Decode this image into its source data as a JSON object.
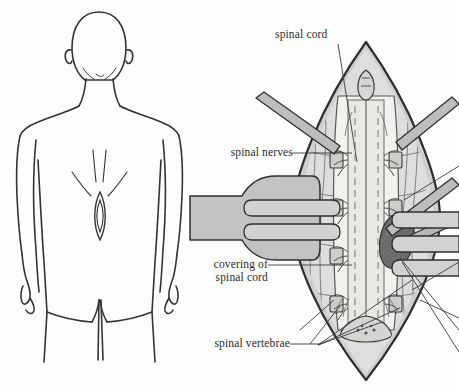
{
  "figure": {
    "type": "medical-illustration",
    "panels": [
      {
        "id": "body-outline",
        "name": "posterior human body outline",
        "view": "rear"
      },
      {
        "id": "spinal-exposure",
        "name": "surgical exposure of spinal cord",
        "view": "detail"
      }
    ]
  },
  "labels": [
    {
      "id": "spinal-cord",
      "text": "spinal cord",
      "align": "left",
      "x": 275,
      "y": 28
    },
    {
      "id": "spinal-nerves",
      "text": "spinal nerves",
      "align": "right",
      "x": 205,
      "y": 147
    },
    {
      "id": "covering",
      "text": "covering of\nspinal cord",
      "align": "right",
      "x": 203,
      "y": 262
    },
    {
      "id": "spinal-vertebrae",
      "text": "spinal vertebrae",
      "align": "right",
      "x": 199,
      "y": 338
    }
  ],
  "colors": {
    "ink": "#2b2b2b",
    "outline": "#333333",
    "tissue_light": "#e3e3e1",
    "tissue_mid": "#c9c9c7",
    "tissue_dark": "#aeaeac",
    "cord_pale": "#f2f1ee",
    "mass_dark": "#6e6e6c",
    "retractor": "#b9b9b7",
    "background": "#fdfdfc"
  },
  "anatomy": {
    "cord_segments": 5,
    "nerve_root_pairs": 5,
    "retractor_arms": 4,
    "lesion": {
      "name": "dark stippled mass",
      "side": "right"
    },
    "back_marker": {
      "name": "incision site oval",
      "region": "lumbar"
    }
  }
}
